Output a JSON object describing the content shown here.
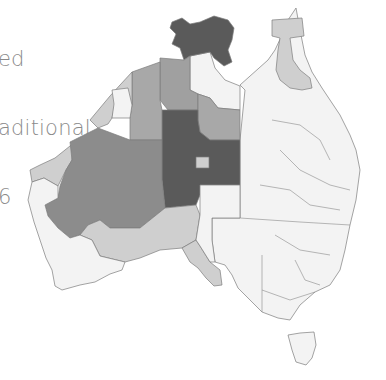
{
  "title": {
    "lines": [
      "ed",
      "aditional",
      "6"
    ]
  },
  "legend_colors": {
    "darkest": "#5a5a5a",
    "dark": "#8c8c8c",
    "medium": "#a8a8a8",
    "light": "#cfcfcf",
    "lightest": "#f3f3f3",
    "outline": "#7c7c7c"
  },
  "map": {
    "type": "choropleth",
    "region": "Australia",
    "shading": "grayscale, darker = higher value",
    "regions": [
      {
        "name": "Top End (NT north)",
        "shade": "darkest"
      },
      {
        "name": "Central NT / Central Australia",
        "shade": "darkest"
      },
      {
        "name": "Western Desert WA",
        "shade": "dark"
      },
      {
        "name": "East Kimberley / Tanami",
        "shade": "dark"
      },
      {
        "name": "Barkly NT",
        "shade": "medium"
      },
      {
        "name": "Kimberley WA",
        "shade": "light"
      },
      {
        "name": "Pilbara WA",
        "shade": "light"
      },
      {
        "name": "Goldfields WA",
        "shade": "light"
      },
      {
        "name": "Cape York QLD",
        "shade": "light"
      },
      {
        "name": "Far North SA",
        "shade": "light"
      },
      {
        "name": "Eyre / West Coast SA",
        "shade": "light"
      },
      {
        "name": "Alice Springs town",
        "shade": "light"
      },
      {
        "name": "Gulf / Katherine",
        "shade": "lightest"
      },
      {
        "name": "Queensland (rest)",
        "shade": "lightest"
      },
      {
        "name": "New South Wales",
        "shade": "lightest"
      },
      {
        "name": "Victoria",
        "shade": "lightest"
      },
      {
        "name": "Tasmania",
        "shade": "lightest"
      },
      {
        "name": "South-west WA",
        "shade": "lightest"
      },
      {
        "name": "SA north-east",
        "shade": "lightest"
      }
    ]
  }
}
